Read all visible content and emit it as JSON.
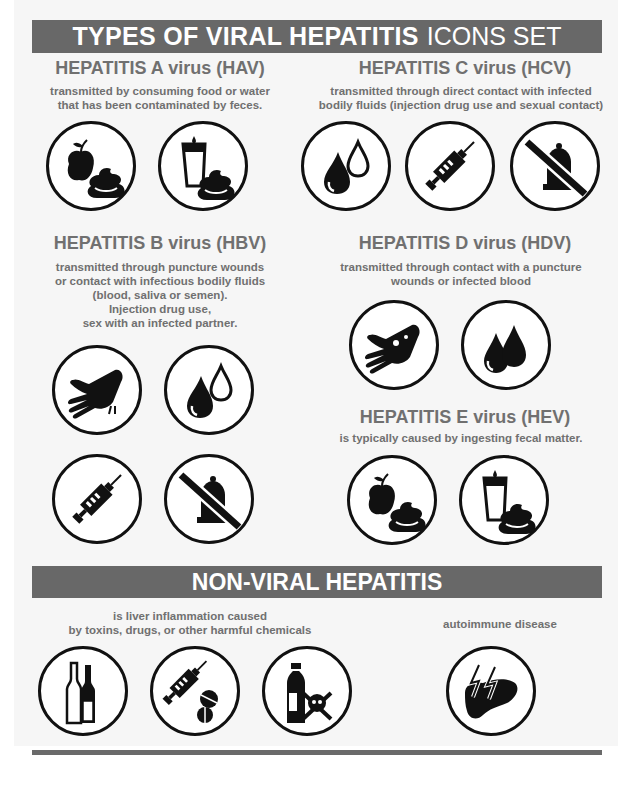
{
  "header": {
    "title_bold": "TYPES OF VIRAL HEPATITIS",
    "title_light": "ICONS SET"
  },
  "sections": {
    "hav": {
      "title": "HEPATITIS A virus (HAV)",
      "description_lines": [
        "transmitted by consuming food or water",
        "that has been contaminated by feces."
      ],
      "icons": [
        "apple-feces-icon",
        "glass-feces-icon"
      ]
    },
    "hcv": {
      "title": "HEPATITIS C virus (HCV)",
      "description_lines": [
        "transmitted through direct contact with infected",
        "bodily fluids (injection drug use and sexual contact)"
      ],
      "icons": [
        "blood-drops-icon",
        "syringe-icon",
        "no-condom-icon"
      ]
    },
    "hbv": {
      "title": "HEPATITIS B  virus (HBV)",
      "description_lines": [
        "transmitted through puncture wounds",
        "or contact with infectious bodily fluids",
        "(blood, saliva or semen).",
        "Injection drug use,",
        "sex with an infected partner."
      ],
      "icons": [
        "bleeding-hand-icon",
        "blood-drops-icon",
        "syringe-icon",
        "no-condom-icon"
      ]
    },
    "hdv": {
      "title": "HEPATITIS D virus (HDV)",
      "description_lines": [
        "transmitted through contact with a puncture",
        "wounds or infected blood"
      ],
      "icons": [
        "wounded-hand-icon",
        "blood-drops-icon"
      ]
    },
    "hev": {
      "title": "HEPATITIS E virus (HEV)",
      "description_lines": [
        "is typically caused by ingesting fecal matter."
      ],
      "icons": [
        "apple-feces-icon",
        "glass-feces-icon"
      ]
    }
  },
  "non_viral": {
    "title": "NON-VIRAL HEPATITIS",
    "toxins": {
      "description_lines": [
        "is liver inflammation caused",
        "by toxins, drugs, or other harmful chemicals"
      ],
      "icons": [
        "alcohol-bottles-icon",
        "syringe-pills-icon",
        "poison-bottle-icon"
      ]
    },
    "autoimmune": {
      "description": "autoimmune disease",
      "icons": [
        "liver-lightning-icon"
      ]
    }
  },
  "colors": {
    "banner": "#686868",
    "heading_text": "#707070",
    "icon_stroke": "#111111",
    "background": "#f6f6f6"
  }
}
